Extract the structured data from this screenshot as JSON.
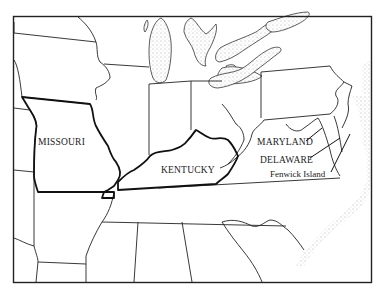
{
  "map": {
    "style": "black-and-white outline map",
    "region": "Eastern United States",
    "colors": {
      "background": "#ffffff",
      "border": "#222222",
      "water_stipple": "#555555"
    },
    "labels": [
      {
        "id": "missouri",
        "text": "MISSOURI",
        "x": 38,
        "y": 143
      },
      {
        "id": "kentucky",
        "text": "KENTUCKY",
        "x": 161,
        "y": 168
      },
      {
        "id": "maryland",
        "text": "MARYLAND",
        "x": 257,
        "y": 141
      },
      {
        "id": "delaware",
        "text": "DELAWARE",
        "x": 260,
        "y": 159
      },
      {
        "id": "fenwick",
        "text": "Fenwick Island",
        "x": 270,
        "y": 173
      }
    ]
  }
}
